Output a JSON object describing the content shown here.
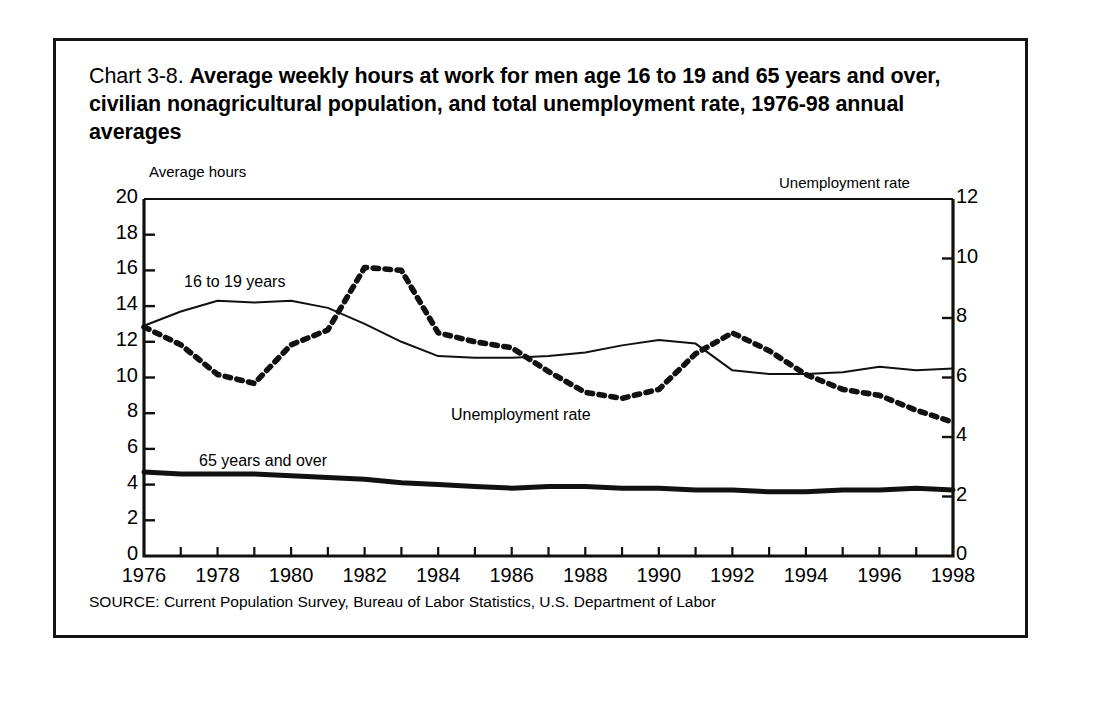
{
  "title": {
    "lead": "Chart 3-8.",
    "strong": "Average weekly hours at work for men age 16 to 19 and 65  years and over, civilian nonagricultural population, and total unemployment rate, 1976-98 annual averages"
  },
  "source": "SOURCE: Current Population Survey, Bureau of Labor Statistics, U.S. Department of Labor",
  "axes": {
    "left_caption": "Average hours",
    "right_caption": "Unemployment rate"
  },
  "annotations": {
    "teen": "16 to 19 years",
    "unemployment": "Unemployment rate",
    "senior": "65 years and over"
  },
  "chart_data": {
    "type": "line",
    "title": "Chart 3-8. Average weekly hours at work for men age 16 to 19 and 65  years and over, civilian nonagricultural population, and total unemployment rate, 1976-98 annual averages",
    "xlabel": "",
    "ylabel": "Average hours",
    "y2label": "Unemployment rate",
    "xlim": [
      1976,
      1998
    ],
    "ylim": [
      0,
      20
    ],
    "y2lim": [
      0,
      12
    ],
    "grid": false,
    "legend": "in-plot annotations",
    "x": [
      1976,
      1977,
      1978,
      1979,
      1980,
      1981,
      1982,
      1983,
      1984,
      1985,
      1986,
      1987,
      1988,
      1989,
      1990,
      1991,
      1992,
      1993,
      1994,
      1995,
      1996,
      1997,
      1998
    ],
    "xticks": [
      1976,
      1978,
      1980,
      1982,
      1984,
      1986,
      1988,
      1990,
      1992,
      1994,
      1996,
      1998
    ],
    "xtick_labels": [
      "1976",
      "1978",
      "1980",
      "1982",
      "1984",
      "1986",
      "1988",
      "1990",
      "1992",
      "1994",
      "1996",
      "1998"
    ],
    "yticks": [
      0,
      2,
      4,
      6,
      8,
      10,
      12,
      14,
      16,
      18,
      20
    ],
    "ytick_labels": [
      "0",
      "2",
      "4",
      "6",
      "8",
      "10",
      "12",
      "14",
      "16",
      "18",
      "20"
    ],
    "y2ticks": [
      0,
      2,
      4,
      6,
      8,
      10,
      12
    ],
    "y2tick_labels": [
      "0",
      "2",
      "4",
      "6",
      "8",
      "10",
      "12"
    ],
    "series": [
      {
        "name": "16 to 19 years",
        "axis": "left",
        "style": "thin-solid",
        "units": "average weekly hours",
        "values": [
          12.9,
          13.7,
          14.3,
          14.2,
          14.3,
          13.9,
          13.0,
          12.0,
          11.2,
          11.1,
          11.1,
          11.2,
          11.4,
          11.8,
          12.1,
          11.9,
          10.4,
          10.2,
          10.2,
          10.3,
          10.6,
          10.4,
          10.5
        ]
      },
      {
        "name": "65 years and over",
        "axis": "left",
        "style": "thick-solid",
        "units": "average weekly hours",
        "values": [
          4.7,
          4.6,
          4.6,
          4.6,
          4.5,
          4.4,
          4.3,
          4.1,
          4.0,
          3.9,
          3.8,
          3.9,
          3.9,
          3.8,
          3.8,
          3.7,
          3.7,
          3.6,
          3.6,
          3.7,
          3.7,
          3.8,
          3.7
        ]
      },
      {
        "name": "Unemployment rate",
        "axis": "right",
        "style": "dotted",
        "units": "percent",
        "values": [
          7.7,
          7.1,
          6.1,
          5.8,
          7.1,
          7.6,
          9.7,
          9.6,
          7.5,
          7.2,
          7.0,
          6.2,
          5.5,
          5.3,
          5.6,
          6.8,
          7.5,
          6.9,
          6.1,
          5.6,
          5.4,
          4.9,
          4.5
        ]
      }
    ]
  }
}
